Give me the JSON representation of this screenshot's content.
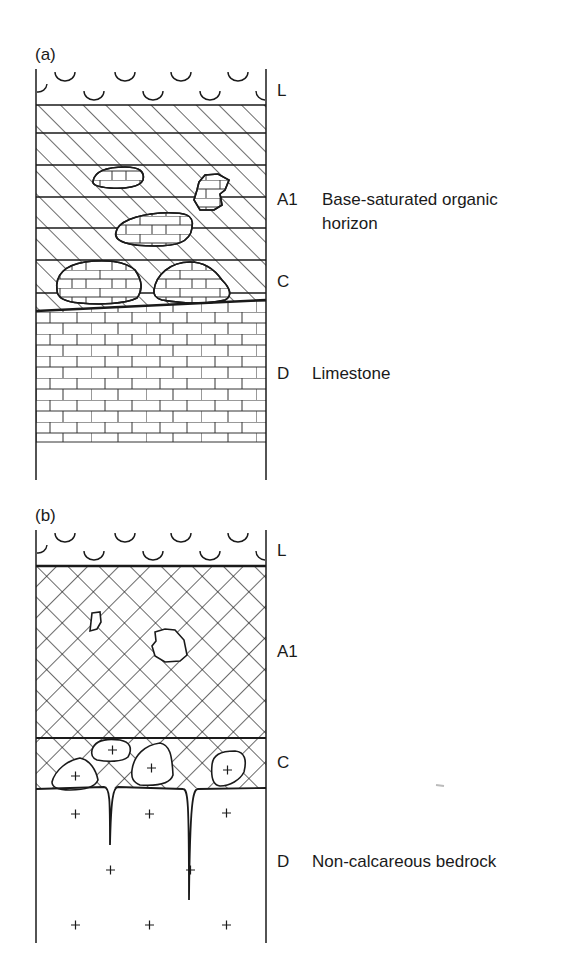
{
  "figure": {
    "panels": [
      {
        "id": "a",
        "label": "(a)",
        "horizons": [
          {
            "code": "L",
            "description": ""
          },
          {
            "code": "A1",
            "description": "Base-saturated organic horizon"
          },
          {
            "code": "C",
            "description": ""
          },
          {
            "code": "D",
            "description": "Limestone"
          }
        ],
        "a1_desc_line1": "Base-saturated organic",
        "a1_desc_line2": "horizon"
      },
      {
        "id": "b",
        "label": "(b)",
        "horizons": [
          {
            "code": "L",
            "description": ""
          },
          {
            "code": "A1",
            "description": ""
          },
          {
            "code": "C",
            "description": ""
          },
          {
            "code": "D",
            "description": "Non-calcareous bedrock"
          }
        ]
      }
    ],
    "patterns": {
      "litter": "arc-symbols",
      "a1_panel_a": "diagonal-hatch-with-horizontal-lines",
      "a1_panel_b": "cross-hatch",
      "limestone": "brick",
      "bedrock": "plus-symbols"
    },
    "colors": {
      "ink": "#1a1a1a",
      "background": "#ffffff"
    }
  }
}
